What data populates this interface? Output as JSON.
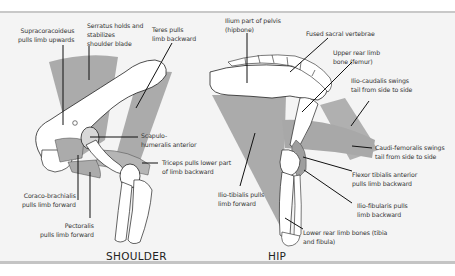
{
  "colors": {
    "background": "#ffffff",
    "panel": "#f4f4f4",
    "panel_border": "#c8c8c8",
    "muscle": "#ababab",
    "muscle_light": "#c4c4c4",
    "bone": "#ffffff",
    "outline": "#222222",
    "leader": "#111111",
    "text": "#333333"
  },
  "shoulder": {
    "title": "SHOULDER",
    "labels": [
      {
        "id": "supracoracoideus",
        "lines": [
          "Supracoracoideus",
          "pulls limb upwards"
        ]
      },
      {
        "id": "serratus",
        "lines": [
          "Serratus holds and",
          "stabilizes",
          "shoulder blade"
        ]
      },
      {
        "id": "teres",
        "lines": [
          "Teres pulls",
          "limb backward"
        ]
      },
      {
        "id": "scapulohumeralis",
        "lines": [
          "Scapulo-",
          "humeralis anterior"
        ]
      },
      {
        "id": "triceps",
        "lines": [
          "Triceps pulls lower part",
          "of limb backward"
        ]
      },
      {
        "id": "coracobrachialis",
        "lines": [
          "Coraco-brachialis",
          "pulls limb forward"
        ]
      },
      {
        "id": "pectoralis",
        "lines": [
          "Pectoralis",
          "pulls limb forward"
        ]
      }
    ]
  },
  "hip": {
    "title": "HIP",
    "labels": [
      {
        "id": "ilium",
        "lines": [
          "Ilium part of pelvis",
          "(hipbone)"
        ]
      },
      {
        "id": "sacral",
        "lines": [
          "Fused sacral vertebrae"
        ]
      },
      {
        "id": "femur",
        "lines": [
          "Upper rear limb",
          "bone (femur)"
        ]
      },
      {
        "id": "iliocaudalis",
        "lines": [
          "Ilio-caudalis swings",
          "tail from side to side"
        ]
      },
      {
        "id": "caudifemoralis",
        "lines": [
          "Caudi-femoralis swings",
          "tail from side to side"
        ]
      },
      {
        "id": "flexortibialis",
        "lines": [
          "Flexor tibialis anterior",
          "pulls limb backward"
        ]
      },
      {
        "id": "iliofibularis",
        "lines": [
          "Ilio-fibularis pulls",
          "limb backward"
        ]
      },
      {
        "id": "iliotibialis",
        "lines": [
          "Ilio-tibialis pulls",
          "limb forward"
        ]
      },
      {
        "id": "tibiafibula",
        "lines": [
          "Lower rear limb bones (tibia",
          "and fibula)"
        ]
      }
    ]
  }
}
